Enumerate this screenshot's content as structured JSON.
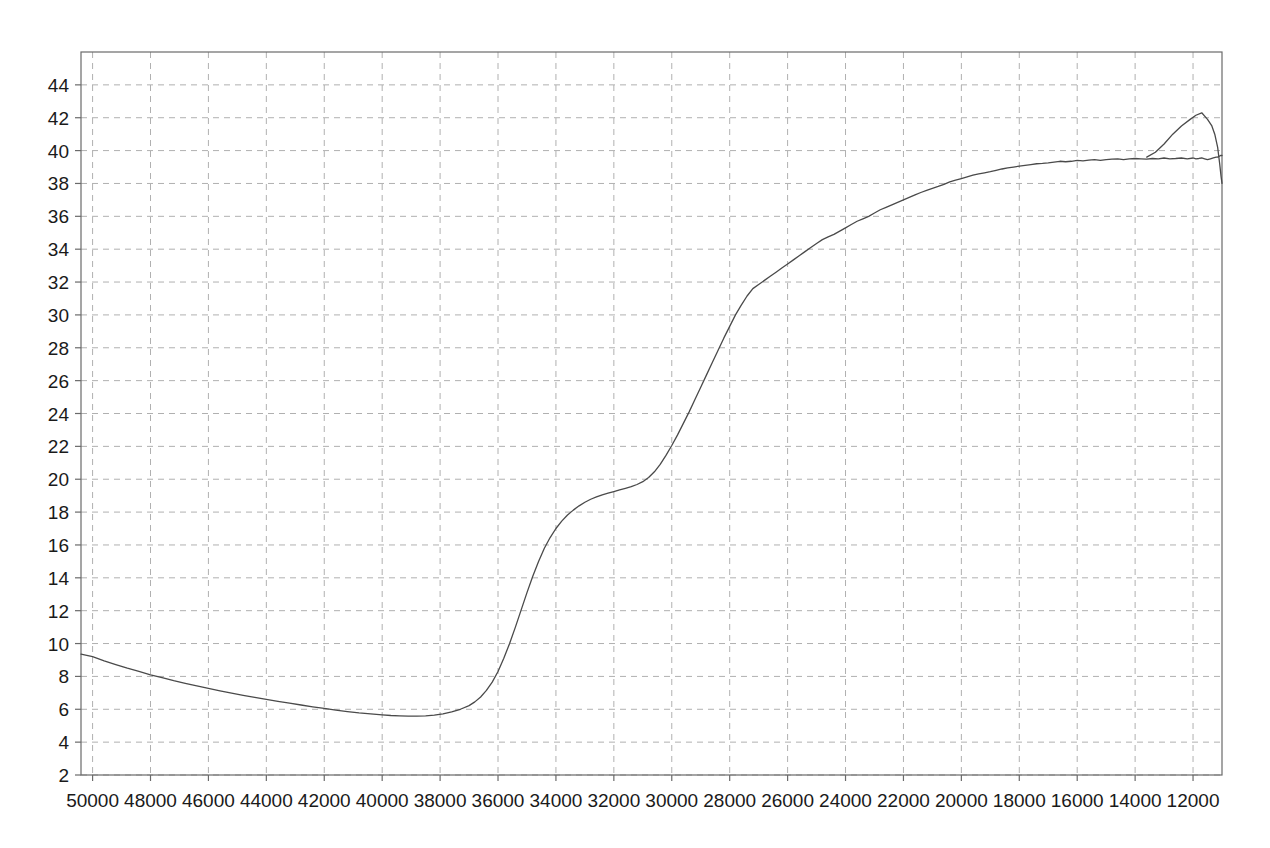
{
  "chart_data": {
    "type": "line",
    "title": "",
    "subtitle": "",
    "xlabel": "",
    "ylabel": "",
    "grid": true,
    "legend": null,
    "x_axis": {
      "reversed": true,
      "min": 11000,
      "max": 50400,
      "tick_step": 2000,
      "ticks": [
        50000,
        48000,
        46000,
        44000,
        42000,
        40000,
        38000,
        36000,
        34000,
        32000,
        30000,
        28000,
        26000,
        24000,
        22000,
        20000,
        18000,
        16000,
        14000,
        12000
      ],
      "tick_labels": [
        "50000",
        "48000",
        "46000",
        "44000",
        "42000",
        "40000",
        "38000",
        "36000",
        "34000",
        "32000",
        "30000",
        "28000",
        "26000",
        "24000",
        "22000",
        "20000",
        "18000",
        "16000",
        "14000",
        "12000"
      ]
    },
    "y_axis": {
      "min": 2,
      "max": 46,
      "tick_step": 2,
      "ticks": [
        44,
        42,
        40,
        38,
        36,
        34,
        32,
        30,
        28,
        26,
        24,
        22,
        20,
        18,
        16,
        14,
        12,
        10,
        8,
        6,
        4,
        2
      ],
      "tick_labels": [
        "44",
        "42",
        "40",
        "38",
        "36",
        "34",
        "32",
        "30",
        "28",
        "26",
        "24",
        "22",
        "20",
        "18",
        "16",
        "14",
        "12",
        "10",
        "8",
        "6",
        "4",
        "2"
      ]
    },
    "series": [
      {
        "name": "trace",
        "color": "#4a4a4a",
        "line_width": 1.3,
        "points": [
          [
            50400,
            9.35
          ],
          [
            50000,
            9.2
          ],
          [
            49600,
            8.95
          ],
          [
            49200,
            8.72
          ],
          [
            48800,
            8.5
          ],
          [
            48400,
            8.3
          ],
          [
            48000,
            8.1
          ],
          [
            47600,
            7.92
          ],
          [
            47200,
            7.74
          ],
          [
            46800,
            7.58
          ],
          [
            46400,
            7.42
          ],
          [
            46000,
            7.27
          ],
          [
            45600,
            7.12
          ],
          [
            45200,
            6.98
          ],
          [
            44800,
            6.85
          ],
          [
            44400,
            6.72
          ],
          [
            44000,
            6.6
          ],
          [
            43600,
            6.48
          ],
          [
            43200,
            6.37
          ],
          [
            42800,
            6.26
          ],
          [
            42400,
            6.15
          ],
          [
            42000,
            6.05
          ],
          [
            41600,
            5.95
          ],
          [
            41200,
            5.86
          ],
          [
            40800,
            5.78
          ],
          [
            40400,
            5.72
          ],
          [
            40000,
            5.66
          ],
          [
            39700,
            5.62
          ],
          [
            39400,
            5.6
          ],
          [
            39100,
            5.58
          ],
          [
            38800,
            5.58
          ],
          [
            38500,
            5.6
          ],
          [
            38200,
            5.64
          ],
          [
            37900,
            5.72
          ],
          [
            37600,
            5.84
          ],
          [
            37300,
            6.0
          ],
          [
            37000,
            6.22
          ],
          [
            36800,
            6.45
          ],
          [
            36600,
            6.75
          ],
          [
            36400,
            7.15
          ],
          [
            36200,
            7.65
          ],
          [
            36000,
            8.3
          ],
          [
            35800,
            9.1
          ],
          [
            35600,
            10.0
          ],
          [
            35400,
            11.0
          ],
          [
            35200,
            12.05
          ],
          [
            35000,
            13.1
          ],
          [
            34800,
            14.1
          ],
          [
            34600,
            15.0
          ],
          [
            34400,
            15.8
          ],
          [
            34200,
            16.45
          ],
          [
            34000,
            17.0
          ],
          [
            33800,
            17.45
          ],
          [
            33600,
            17.82
          ],
          [
            33400,
            18.12
          ],
          [
            33200,
            18.38
          ],
          [
            33000,
            18.6
          ],
          [
            32800,
            18.78
          ],
          [
            32600,
            18.92
          ],
          [
            32400,
            19.05
          ],
          [
            32200,
            19.15
          ],
          [
            32000,
            19.25
          ],
          [
            31800,
            19.35
          ],
          [
            31600,
            19.45
          ],
          [
            31400,
            19.55
          ],
          [
            31200,
            19.68
          ],
          [
            31000,
            19.85
          ],
          [
            30800,
            20.1
          ],
          [
            30600,
            20.45
          ],
          [
            30400,
            20.9
          ],
          [
            30200,
            21.45
          ],
          [
            30000,
            22.05
          ],
          [
            29800,
            22.7
          ],
          [
            29600,
            23.4
          ],
          [
            29400,
            24.1
          ],
          [
            29200,
            24.85
          ],
          [
            29000,
            25.6
          ],
          [
            28800,
            26.35
          ],
          [
            28600,
            27.1
          ],
          [
            28400,
            27.85
          ],
          [
            28200,
            28.6
          ],
          [
            28000,
            29.3
          ],
          [
            27800,
            30.0
          ],
          [
            27600,
            30.6
          ],
          [
            27400,
            31.15
          ],
          [
            27200,
            31.6
          ],
          [
            27000,
            31.85
          ],
          [
            26800,
            32.1
          ],
          [
            26600,
            32.35
          ],
          [
            26400,
            32.6
          ],
          [
            26200,
            32.85
          ],
          [
            26000,
            33.1
          ],
          [
            25800,
            33.35
          ],
          [
            25600,
            33.6
          ],
          [
            25400,
            33.85
          ],
          [
            25200,
            34.1
          ],
          [
            25000,
            34.35
          ],
          [
            24800,
            34.58
          ],
          [
            24600,
            34.75
          ],
          [
            24400,
            34.9
          ],
          [
            24200,
            35.1
          ],
          [
            24000,
            35.3
          ],
          [
            23800,
            35.5
          ],
          [
            23600,
            35.7
          ],
          [
            23400,
            35.85
          ],
          [
            23200,
            36.0
          ],
          [
            23000,
            36.2
          ],
          [
            22800,
            36.4
          ],
          [
            22600,
            36.55
          ],
          [
            22400,
            36.7
          ],
          [
            22200,
            36.85
          ],
          [
            22000,
            37.0
          ],
          [
            21800,
            37.15
          ],
          [
            21600,
            37.3
          ],
          [
            21400,
            37.45
          ],
          [
            21200,
            37.58
          ],
          [
            21000,
            37.7
          ],
          [
            20800,
            37.82
          ],
          [
            20600,
            37.95
          ],
          [
            20400,
            38.1
          ],
          [
            20200,
            38.2
          ],
          [
            20000,
            38.3
          ],
          [
            19800,
            38.4
          ],
          [
            19600,
            38.5
          ],
          [
            19400,
            38.58
          ],
          [
            19200,
            38.65
          ],
          [
            19000,
            38.72
          ],
          [
            18800,
            38.8
          ],
          [
            18600,
            38.88
          ],
          [
            18400,
            38.95
          ],
          [
            18200,
            39.0
          ],
          [
            18000,
            39.05
          ],
          [
            17800,
            39.1
          ],
          [
            17600,
            39.15
          ],
          [
            17400,
            39.2
          ],
          [
            17200,
            39.22
          ],
          [
            17000,
            39.25
          ],
          [
            16800,
            39.3
          ],
          [
            16600,
            39.35
          ],
          [
            16400,
            39.32
          ],
          [
            16200,
            39.35
          ],
          [
            16000,
            39.4
          ],
          [
            15800,
            39.38
          ],
          [
            15600,
            39.42
          ],
          [
            15400,
            39.45
          ],
          [
            15200,
            39.4
          ],
          [
            15000,
            39.45
          ],
          [
            14800,
            39.48
          ],
          [
            14600,
            39.5
          ],
          [
            14400,
            39.45
          ],
          [
            14200,
            39.5
          ],
          [
            14000,
            39.52
          ],
          [
            13800,
            39.5
          ],
          [
            13600,
            39.48
          ],
          [
            13400,
            39.52
          ],
          [
            13200,
            39.5
          ],
          [
            13000,
            39.55
          ],
          [
            12800,
            39.5
          ],
          [
            12600,
            39.52
          ],
          [
            12400,
            39.55
          ],
          [
            12200,
            39.5
          ],
          [
            12000,
            39.55
          ],
          [
            11900,
            39.5
          ],
          [
            11800,
            39.52
          ],
          [
            11700,
            39.55
          ],
          [
            11600,
            39.5
          ],
          [
            11500,
            39.45
          ],
          [
            11400,
            39.5
          ],
          [
            11300,
            39.55
          ],
          [
            11200,
            39.6
          ],
          [
            11150,
            39.6
          ],
          [
            11100,
            39.65
          ],
          [
            11050,
            39.7
          ],
          [
            11000,
            39.7
          ]
        ]
      }
    ],
    "notes": {
      "start_value": 9.2,
      "minimum_value": 5.4,
      "minimum_at_x": 42000,
      "shoulder_value": 19.5,
      "shoulder_at_x": 35500,
      "plateau_value": 39.6,
      "plateau_range_x": [
        24000,
        15000
      ],
      "peak_value": 42.3,
      "peak_at_x": 11700,
      "end_value": 38.0
    }
  },
  "axis_style": {
    "grid_color": "#b0b0b0",
    "axis_color": "#6a6a6a",
    "line_color": "#4a4a4a",
    "background": "#ffffff"
  }
}
